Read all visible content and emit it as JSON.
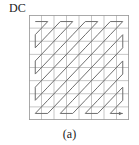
{
  "figure": {
    "name": "jpeg-zigzag-scan-order",
    "dc_label": "DC",
    "caption": "(a)",
    "colors": {
      "grid_line": "#b9b9b9",
      "border": "#9a9a9a",
      "path": "#6e6e6e",
      "text": "#1a1a1a",
      "background": "#ffffff"
    }
  },
  "chart_data": {
    "type": "diagram",
    "title": "(a)",
    "annotations": [
      "DC"
    ],
    "grid": {
      "rows": 8,
      "columns": 8,
      "cell_width": 12.5,
      "cell_height": 13.125,
      "show_grid": true
    },
    "scan": {
      "name": "zigzag",
      "start_label": "DC",
      "start_cell": [
        0,
        0
      ],
      "end_cell": [
        7,
        7
      ],
      "arrow_at_end": true,
      "order": [
        [
          0,
          0
        ],
        [
          0,
          1
        ],
        [
          1,
          0
        ],
        [
          2,
          0
        ],
        [
          1,
          1
        ],
        [
          0,
          2
        ],
        [
          0,
          3
        ],
        [
          1,
          2
        ],
        [
          2,
          1
        ],
        [
          3,
          0
        ],
        [
          4,
          0
        ],
        [
          3,
          1
        ],
        [
          2,
          2
        ],
        [
          1,
          3
        ],
        [
          0,
          4
        ],
        [
          0,
          5
        ],
        [
          1,
          4
        ],
        [
          2,
          3
        ],
        [
          3,
          2
        ],
        [
          4,
          1
        ],
        [
          5,
          0
        ],
        [
          6,
          0
        ],
        [
          5,
          1
        ],
        [
          4,
          2
        ],
        [
          3,
          3
        ],
        [
          2,
          4
        ],
        [
          1,
          5
        ],
        [
          0,
          6
        ],
        [
          0,
          7
        ],
        [
          1,
          6
        ],
        [
          2,
          5
        ],
        [
          3,
          4
        ],
        [
          4,
          3
        ],
        [
          5,
          2
        ],
        [
          6,
          1
        ],
        [
          7,
          0
        ],
        [
          7,
          1
        ],
        [
          6,
          2
        ],
        [
          5,
          3
        ],
        [
          4,
          4
        ],
        [
          3,
          5
        ],
        [
          2,
          6
        ],
        [
          1,
          7
        ],
        [
          2,
          7
        ],
        [
          3,
          6
        ],
        [
          4,
          5
        ],
        [
          5,
          4
        ],
        [
          6,
          3
        ],
        [
          7,
          2
        ],
        [
          7,
          3
        ],
        [
          6,
          4
        ],
        [
          5,
          5
        ],
        [
          4,
          6
        ],
        [
          3,
          7
        ],
        [
          4,
          7
        ],
        [
          5,
          6
        ],
        [
          6,
          5
        ],
        [
          7,
          4
        ],
        [
          7,
          5
        ],
        [
          6,
          6
        ],
        [
          5,
          7
        ],
        [
          6,
          7
        ],
        [
          7,
          6
        ],
        [
          7,
          7
        ]
      ]
    }
  }
}
